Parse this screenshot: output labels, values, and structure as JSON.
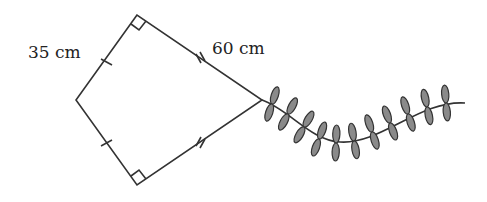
{
  "diagram": {
    "type": "kite",
    "labels": {
      "short_side": "35 cm",
      "long_side": "60 cm"
    },
    "colors": {
      "stroke": "#333333",
      "bow_fill": "#8a8a8a",
      "text": "#222222"
    },
    "vertices": {
      "top": [
        137,
        15
      ],
      "left": [
        76,
        100
      ],
      "right": [
        262,
        100
      ],
      "bottom": [
        137,
        185
      ]
    },
    "tail_bow_count": 14
  }
}
